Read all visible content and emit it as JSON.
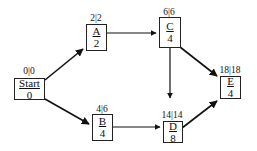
{
  "diagram": {
    "type": "activity-on-node network (critical path)",
    "nodes": [
      {
        "id": "start",
        "name": "Start",
        "duration": "0",
        "label": "0|0"
      },
      {
        "id": "a",
        "name": "A",
        "duration": "2",
        "label": "2|2"
      },
      {
        "id": "b",
        "name": "B",
        "duration": "4",
        "label": "4|6"
      },
      {
        "id": "c",
        "name": "C",
        "duration": "4",
        "label": "6|6"
      },
      {
        "id": "d",
        "name": "D",
        "duration": "8",
        "label": "14|14"
      },
      {
        "id": "e",
        "name": "E",
        "duration": "4",
        "label": "18|18"
      }
    ],
    "edges": [
      {
        "from": "Start",
        "to": "A"
      },
      {
        "from": "Start",
        "to": "B"
      },
      {
        "from": "A",
        "to": "C"
      },
      {
        "from": "B",
        "to": "D"
      },
      {
        "from": "C",
        "to": "D"
      },
      {
        "from": "C",
        "to": "E"
      },
      {
        "from": "D",
        "to": "E"
      }
    ]
  }
}
